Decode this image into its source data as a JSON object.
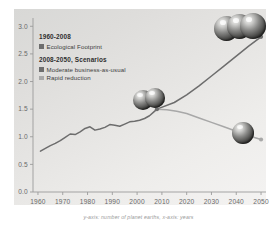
{
  "caption": "y-axis: number of planet earths, x-axis: years",
  "legend": {
    "section1_title": "1960-2008",
    "section1_items": [
      {
        "label": "Ecological Footprint",
        "color": "#6d6d6d",
        "swatch": "legend-swatch-historical"
      }
    ],
    "section2_title": "2008-2050, Scenarios",
    "section2_items": [
      {
        "label": "Moderate business-as-usual",
        "color": "#6d6d6d",
        "swatch": "legend-swatch-business-as-usual"
      },
      {
        "label": "Rapid reduction",
        "color": "#a8a8a8",
        "swatch": "legend-swatch-rapid-reduction"
      }
    ]
  },
  "chart_data": {
    "type": "line",
    "title": "",
    "subtitle": "",
    "xlabel": "years",
    "ylabel": "number of planet earths",
    "xlim": [
      1958,
      2052
    ],
    "ylim": [
      0.0,
      3.15
    ],
    "grid": false,
    "legend_position": "top-left-inside",
    "xticks": [
      1960,
      1970,
      1980,
      1990,
      2000,
      2010,
      2020,
      2030,
      2040,
      2050
    ],
    "yticks": [
      "0.0",
      "0.5",
      "1.0",
      "1.5",
      "2.0",
      "2.5",
      "3.0"
    ],
    "ytick_values": [
      0.0,
      0.5,
      1.0,
      1.5,
      2.0,
      2.5,
      3.0
    ],
    "series": [
      {
        "name": "Ecological Footprint",
        "period": "1960-2008",
        "color": "#6d6d6d",
        "x": [
          1961,
          1963,
          1965,
          1967,
          1969,
          1971,
          1973,
          1975,
          1977,
          1979,
          1981,
          1983,
          1985,
          1987,
          1989,
          1991,
          1993,
          1995,
          1997,
          1999,
          2001,
          2003,
          2005,
          2007,
          2008
        ],
        "y": [
          0.74,
          0.79,
          0.84,
          0.88,
          0.93,
          0.99,
          1.05,
          1.04,
          1.09,
          1.15,
          1.18,
          1.12,
          1.14,
          1.17,
          1.22,
          1.21,
          1.19,
          1.23,
          1.27,
          1.28,
          1.3,
          1.33,
          1.38,
          1.46,
          1.5
        ]
      },
      {
        "name": "Moderate business-as-usual",
        "period": "2008-2050",
        "color": "#6d6d6d",
        "x": [
          2008,
          2015,
          2020,
          2025,
          2030,
          2035,
          2040,
          2045,
          2050
        ],
        "y": [
          1.5,
          1.62,
          1.76,
          1.92,
          2.1,
          2.28,
          2.46,
          2.64,
          2.81
        ]
      },
      {
        "name": "Rapid reduction",
        "period": "2008-2050",
        "color": "#a8a8a8",
        "x": [
          2008,
          2012,
          2016,
          2020,
          2025,
          2030,
          2035,
          2040,
          2045,
          2050
        ],
        "y": [
          1.5,
          1.49,
          1.46,
          1.42,
          1.34,
          1.26,
          1.18,
          1.1,
          1.02,
          0.95
        ]
      }
    ],
    "annotations": [
      {
        "name": "three-earths-marker",
        "value": 3,
        "near_point": [
          2050,
          2.81
        ],
        "description": "three earth globes"
      },
      {
        "name": "one-and-half-earths-marker",
        "value": 1.5,
        "near_point": [
          2008,
          1.5
        ],
        "description": "one and a half earth globes"
      },
      {
        "name": "one-earth-marker",
        "value": 1,
        "near_point": [
          2050,
          0.95
        ],
        "description": "one earth globe"
      }
    ],
    "endpoints": [
      {
        "name": "business-as-usual-endpoint",
        "x": 2050,
        "y": 2.81
      },
      {
        "name": "rapid-reduction-endpoint",
        "x": 2050,
        "y": 0.95
      },
      {
        "name": "scenario-split-point",
        "x": 2008,
        "y": 1.5
      }
    ]
  }
}
